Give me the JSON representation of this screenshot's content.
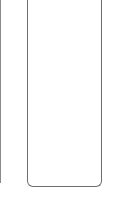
{
  "colors": {
    "background": "#ffffff",
    "panel_border": "#6e6e6e",
    "left_edge": "#8a8a8a"
  },
  "panel": {
    "content": ""
  }
}
